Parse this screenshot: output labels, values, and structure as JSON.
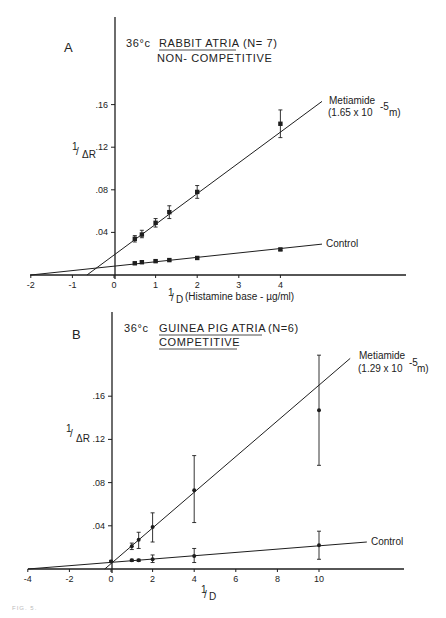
{
  "figure": {
    "panels": [
      {
        "letter": "A",
        "title_prefix": "36°c",
        "title_underlined": "RABBIT ATRIA",
        "title_suffix": "(N= 7)",
        "subtitle": "NON- COMPETITIVE",
        "subtitle_underlined": false,
        "ylabel_num": "1",
        "ylabel_den": "ΔR",
        "xlabel_num": "1",
        "xlabel_den": "D",
        "xlabel_extra": "(Histamine base - µg/ml)",
        "metiamide_label": "Metiamide",
        "metiamide_conc": "(1.65 x 10",
        "metiamide_exp": "-5",
        "metiamide_unit": "m)",
        "control_label": "Control"
      },
      {
        "letter": "B",
        "title_prefix": "36°c",
        "title_underlined": "GUINEA PIG ATRIA",
        "title_suffix": "(N=6)",
        "subtitle": "COMPETITIVE",
        "subtitle_underlined": true,
        "ylabel_num": "1",
        "ylabel_den": "ΔR",
        "xlabel_num": "1",
        "xlabel_den": "D",
        "xlabel_extra": "",
        "metiamide_label": "Metiamide",
        "metiamide_conc": "(1.29 x 10",
        "metiamide_exp": "-5",
        "metiamide_unit": "m)",
        "control_label": "Control"
      }
    ],
    "caption": "FIG. 5."
  },
  "chart_data": [
    {
      "type": "line",
      "panel": "A",
      "title": "36°c RABBIT ATRIA (N=7) NON-COMPETITIVE",
      "xlabel": "1/D (Histamine base - µg/ml)",
      "ylabel": "1/ΔR",
      "xlim": [
        -2,
        6.9
      ],
      "ylim": [
        0,
        0.2
      ],
      "xticks": [
        -2,
        -1,
        0,
        1,
        2,
        3,
        4
      ],
      "xtick_labels": [
        "-2",
        "-1",
        "0",
        "1",
        "2",
        "3",
        "4"
      ],
      "yticks": [
        0.04,
        0.08,
        0.12,
        0.16
      ],
      "ytick_labels": [
        ".04",
        ".08",
        ".12",
        ".16"
      ],
      "grid": false,
      "series": [
        {
          "name": "Metiamide (1.65 x 10^-5 m)",
          "marker": "square",
          "x": [
            0.5,
            0.67,
            1.0,
            1.33,
            2.0,
            4.0
          ],
          "y": [
            0.034,
            0.038,
            0.049,
            0.059,
            0.078,
            0.142
          ],
          "err_low": [
            0.031,
            0.035,
            0.045,
            0.053,
            0.072,
            0.129
          ],
          "err_high": [
            0.037,
            0.042,
            0.053,
            0.065,
            0.084,
            0.155
          ],
          "fit_line": {
            "x": [
              -0.65,
              5.0
            ],
            "y": [
              0.0,
              0.163
            ]
          }
        },
        {
          "name": "Control",
          "marker": "square",
          "x": [
            0.5,
            0.67,
            1.0,
            1.33,
            2.0,
            4.0
          ],
          "y": [
            0.011,
            0.012,
            0.013,
            0.014,
            0.016,
            0.024
          ],
          "err_low": [
            0.01,
            0.011,
            0.012,
            0.013,
            0.015,
            0.023
          ],
          "err_high": [
            0.012,
            0.013,
            0.014,
            0.015,
            0.017,
            0.025
          ],
          "fit_line": {
            "x": [
              -2.0,
              5.0
            ],
            "y": [
              0.0,
              0.029
            ]
          }
        }
      ]
    },
    {
      "type": "line",
      "panel": "B",
      "title": "36°c GUINEA PIG ATRIA (N=6) COMPETITIVE",
      "xlabel": "1/D",
      "ylabel": "1/ΔR",
      "xlim": [
        -4,
        14
      ],
      "ylim": [
        0,
        0.2
      ],
      "xticks": [
        -4,
        -2,
        0,
        2,
        4,
        6,
        8,
        10
      ],
      "xtick_labels": [
        "-4",
        "-2",
        "0",
        "2",
        "4",
        "6",
        "8",
        "10"
      ],
      "yticks": [
        0.04,
        0.08,
        0.12,
        0.16
      ],
      "ytick_labels": [
        ".04",
        ".08",
        ".12",
        ".16"
      ],
      "grid": false,
      "series": [
        {
          "name": "Metiamide (1.29 x 10^-5 m)",
          "marker": "circle",
          "x": [
            1.0,
            1.33,
            2.0,
            4.0,
            10.0
          ],
          "y": [
            0.021,
            0.027,
            0.039,
            0.073,
            0.147
          ],
          "err_low": [
            0.018,
            0.019,
            0.025,
            0.043,
            0.096
          ],
          "err_high": [
            0.024,
            0.034,
            0.052,
            0.105,
            0.198
          ],
          "fit_line": {
            "x": [
              -0.3,
              11.5
            ],
            "y": [
              0.0,
              0.195
            ]
          }
        },
        {
          "name": "Control",
          "marker": "circle",
          "x": [
            0.0,
            1.0,
            1.33,
            2.0,
            4.0,
            10.0
          ],
          "y": [
            0.007,
            0.008,
            0.008,
            0.009,
            0.012,
            0.022
          ],
          "err_low": [
            0.006,
            0.007,
            0.007,
            0.006,
            0.006,
            0.009
          ],
          "err_high": [
            0.008,
            0.009,
            0.009,
            0.013,
            0.019,
            0.035
          ],
          "fit_line": {
            "x": [
              -4.0,
              12.3
            ],
            "y": [
              0.0,
              0.025
            ]
          }
        }
      ]
    }
  ]
}
